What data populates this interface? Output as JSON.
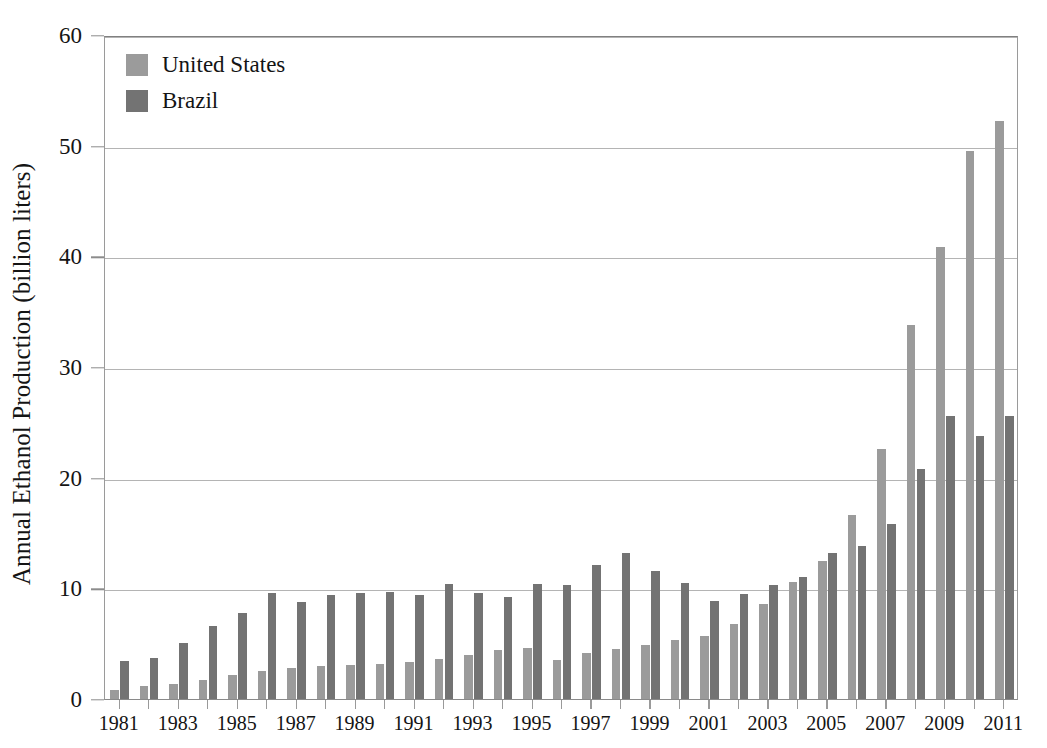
{
  "chart_data": {
    "type": "bar",
    "title": "",
    "xlabel": "",
    "ylabel": "Annual Ethanol Production (billion liters)",
    "ylim": [
      0,
      60
    ],
    "yticks": [
      0,
      10,
      20,
      30,
      40,
      50,
      60
    ],
    "ytick_labels": [
      "0",
      "10",
      "20",
      "30",
      "40",
      "50",
      "60"
    ],
    "grid": true,
    "grid_axis": "y",
    "legend_position": "top-left",
    "categories": [
      "1981",
      "1982",
      "1983",
      "1984",
      "1985",
      "1986",
      "1987",
      "1988",
      "1989",
      "1990",
      "1991",
      "1992",
      "1993",
      "1994",
      "1995",
      "1996",
      "1997",
      "1998",
      "1999",
      "2000",
      "2001",
      "2002",
      "2003",
      "2004",
      "2005",
      "2006",
      "2007",
      "2008",
      "2009",
      "2010",
      "2011"
    ],
    "xtick_labels": [
      "1981",
      "1983",
      "1985",
      "1987",
      "1989",
      "1991",
      "1993",
      "1995",
      "1997",
      "1999",
      "2001",
      "2003",
      "2005",
      "2007",
      "2009",
      "2011"
    ],
    "series": [
      {
        "name": "United States",
        "color": "#9b9b9b",
        "values": [
          0.8,
          1.2,
          1.4,
          1.7,
          2.2,
          2.5,
          2.8,
          3.0,
          3.1,
          3.2,
          3.3,
          3.6,
          4.0,
          4.4,
          4.6,
          3.5,
          4.2,
          4.5,
          4.9,
          5.3,
          5.7,
          6.8,
          8.6,
          10.6,
          12.5,
          16.6,
          22.6,
          33.8,
          40.8,
          49.5,
          52.2
        ]
      },
      {
        "name": "Brazil",
        "color": "#737373",
        "values": [
          3.4,
          3.7,
          5.1,
          6.6,
          7.8,
          9.6,
          8.8,
          9.4,
          9.6,
          9.7,
          9.4,
          10.4,
          9.6,
          9.2,
          10.4,
          10.3,
          12.1,
          13.2,
          11.6,
          10.5,
          8.9,
          9.5,
          10.3,
          11.0,
          13.2,
          13.8,
          15.8,
          20.8,
          25.6,
          23.8,
          25.6
        ]
      }
    ]
  },
  "legend": {
    "items": [
      {
        "label": "United States",
        "color": "#9b9b9b"
      },
      {
        "label": "Brazil",
        "color": "#737373"
      }
    ]
  },
  "axes": {
    "y_title": "Annual Ethanol Production (billion liters)"
  }
}
